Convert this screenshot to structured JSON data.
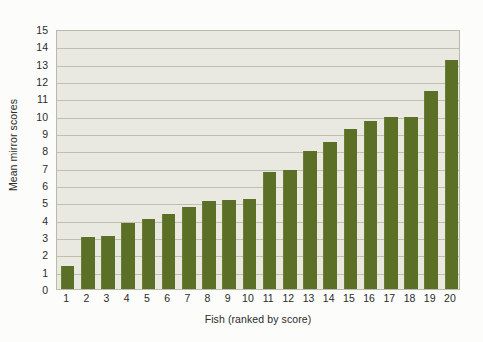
{
  "chart_data": {
    "type": "bar",
    "title": "",
    "xlabel": "Fish (ranked by score)",
    "ylabel": "Mean mirror scores",
    "categories": [
      "1",
      "2",
      "3",
      "4",
      "5",
      "6",
      "7",
      "8",
      "9",
      "10",
      "11",
      "12",
      "13",
      "14",
      "15",
      "16",
      "17",
      "18",
      "19",
      "20"
    ],
    "values": [
      1.35,
      3.0,
      3.05,
      3.8,
      4.05,
      4.3,
      4.75,
      5.05,
      5.15,
      5.2,
      6.75,
      6.85,
      7.95,
      8.5,
      9.25,
      9.7,
      9.9,
      9.9,
      11.4,
      13.2
    ],
    "ylim": [
      0,
      15
    ],
    "yticks": [
      0,
      1,
      2,
      3,
      4,
      5,
      6,
      7,
      8,
      9,
      10,
      11,
      12,
      13,
      14,
      15
    ],
    "ytick_labels": [
      "0",
      "1",
      "2",
      "3",
      "4",
      "5",
      "6",
      "7",
      "8",
      "9",
      "10",
      "11",
      "12",
      "13",
      "14",
      "15"
    ],
    "grid": true,
    "grid_axis": "y",
    "legend": false,
    "legend_position": "none",
    "series": [
      {
        "name": "Mean mirror scores",
        "values": [
          1.35,
          3.0,
          3.05,
          3.8,
          4.05,
          4.3,
          4.75,
          5.05,
          5.15,
          5.2,
          6.75,
          6.85,
          7.95,
          8.5,
          9.25,
          9.7,
          9.9,
          9.9,
          11.4,
          13.2
        ]
      }
    ]
  },
  "colors": {
    "bar": "#5c6f26",
    "plot_background": "#e9e9e1",
    "page_background": "#fcfcfa",
    "gridline": "#b7b7a6",
    "axis_border": "#b9b9ac",
    "text": "#2b2b2b"
  }
}
